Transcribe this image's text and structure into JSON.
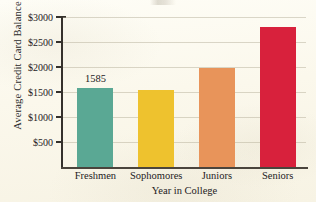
{
  "chart_data": {
    "type": "bar",
    "title": "",
    "xlabel": "Year in College",
    "ylabel": "Average Credit Card Balance",
    "categories": [
      "Freshmen",
      "Sophomores",
      "Juniors",
      "Seniors"
    ],
    "values": [
      1585,
      1550,
      1975,
      2800
    ],
    "value_labels": [
      "1585",
      "",
      "",
      ""
    ],
    "ylim": [
      0,
      3000
    ],
    "yticks": [
      500,
      1000,
      1500,
      2000,
      2500,
      3000
    ],
    "ytick_labels": [
      "$500",
      "$1000",
      "$1500",
      "$2000",
      "$2500",
      "$3000"
    ],
    "grid": true,
    "legend": "none",
    "bar_colors": [
      "#5aa894",
      "#eec22e",
      "#e8945a",
      "#d8213c"
    ],
    "series": [
      {
        "name": "Average Credit Card Balance",
        "values": [
          1585,
          1550,
          1975,
          2800
        ]
      }
    ]
  },
  "axes": {
    "y_title": "Average Credit Card Balance",
    "x_title": "Year in College"
  },
  "colors": {
    "freshmen": "#5aa894",
    "sophomores": "#eec22e",
    "juniors": "#e8945a",
    "seniors": "#d8213c",
    "paper": "#fdfbf2",
    "axis": "#35312c",
    "gridline": "#b0a892",
    "text": "#24211d"
  }
}
